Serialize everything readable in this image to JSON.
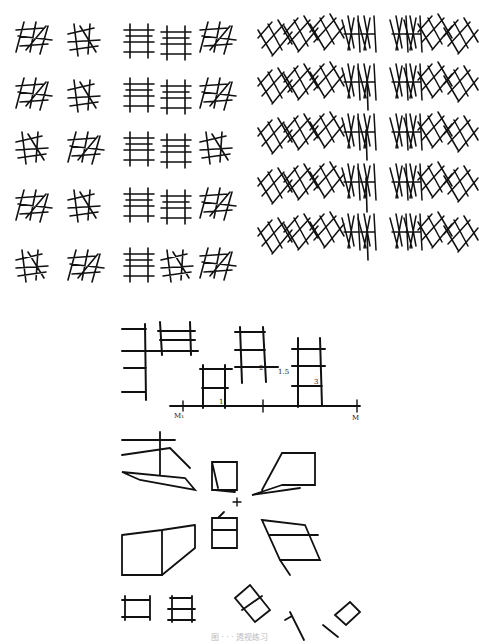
{
  "figure": {
    "panels": [
      {
        "id": "panel-top-left",
        "description": "Grid of 5x5 cubes sketched with rotating orientation",
        "rows": 5,
        "cols": 5
      },
      {
        "id": "panel-top-right",
        "description": "Rows of lattice cubes converging toward a central vertical axis",
        "rows": 5
      },
      {
        "id": "panel-vanishing-scale",
        "description": "Box proportion study on a horizon line with measuring points",
        "labels": {
          "m1": "M₁",
          "m": "M",
          "p1": "1",
          "p2": "2",
          "p15": "1.5",
          "p3": "3"
        }
      },
      {
        "id": "panel-perspective-boxes",
        "description": "Boxes seen from above and below around a central vanishing point",
        "center_mark": "+"
      },
      {
        "id": "panel-rotated-boxes",
        "description": "Boxes rotated at various angles"
      }
    ],
    "caption": "图 · · · 透视练习"
  },
  "colors": {
    "ink": "#111111",
    "paper": "#ffffff",
    "caption": "#bbbbbb"
  }
}
